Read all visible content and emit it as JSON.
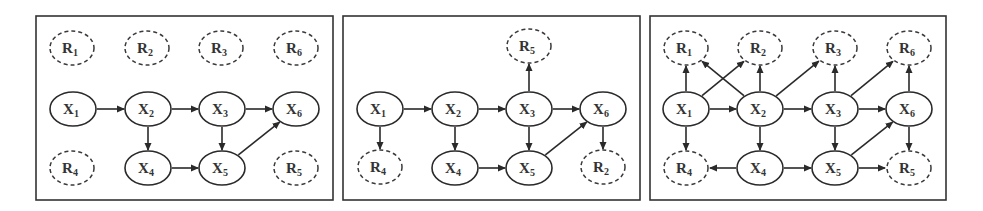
{
  "figure": {
    "width": 983,
    "height": 211,
    "colors": {
      "stroke": "#2a2a2a",
      "label": "#333333",
      "background": "#ffffff"
    },
    "panels": [
      {
        "id": "panel-1",
        "frame": {
          "x": 36,
          "y": 16,
          "w": 297,
          "h": 184
        },
        "nodes": [
          {
            "id": "R1",
            "letter": "R",
            "sub": "1",
            "type": "missing",
            "cx": 72,
            "cy": 48
          },
          {
            "id": "R2",
            "letter": "R",
            "sub": "2",
            "type": "missing",
            "cx": 147,
            "cy": 48
          },
          {
            "id": "R3",
            "letter": "R",
            "sub": "3",
            "type": "missing",
            "cx": 221,
            "cy": 48
          },
          {
            "id": "R6",
            "letter": "R",
            "sub": "6",
            "type": "missing",
            "cx": 296,
            "cy": 48
          },
          {
            "id": "X1",
            "letter": "X",
            "sub": "1",
            "type": "observed",
            "cx": 73,
            "cy": 109
          },
          {
            "id": "X2",
            "letter": "X",
            "sub": "2",
            "type": "observed",
            "cx": 148,
            "cy": 109
          },
          {
            "id": "X3",
            "letter": "X",
            "sub": "3",
            "type": "observed",
            "cx": 222,
            "cy": 109
          },
          {
            "id": "X6",
            "letter": "X",
            "sub": "6",
            "type": "observed",
            "cx": 296,
            "cy": 109
          },
          {
            "id": "R4",
            "letter": "R",
            "sub": "4",
            "type": "missing",
            "cx": 72,
            "cy": 168
          },
          {
            "id": "X4",
            "letter": "X",
            "sub": "4",
            "type": "observed",
            "cx": 148,
            "cy": 168
          },
          {
            "id": "X5",
            "letter": "X",
            "sub": "5",
            "type": "observed",
            "cx": 222,
            "cy": 168
          },
          {
            "id": "R5",
            "letter": "R",
            "sub": "5",
            "type": "missing",
            "cx": 296,
            "cy": 168
          }
        ],
        "edges": [
          [
            "X1",
            "X2"
          ],
          [
            "X2",
            "X3"
          ],
          [
            "X3",
            "X6"
          ],
          [
            "X2",
            "X4"
          ],
          [
            "X3",
            "X5"
          ],
          [
            "X4",
            "X5"
          ],
          [
            "X5",
            "X6"
          ]
        ]
      },
      {
        "id": "panel-2",
        "frame": {
          "x": 343,
          "y": 16,
          "w": 297,
          "h": 184
        },
        "nodes": [
          {
            "id": "R5",
            "letter": "R",
            "sub": "5",
            "type": "missing",
            "cx": 529,
            "cy": 46
          },
          {
            "id": "X1",
            "letter": "X",
            "sub": "1",
            "type": "observed",
            "cx": 380,
            "cy": 109
          },
          {
            "id": "X2",
            "letter": "X",
            "sub": "2",
            "type": "observed",
            "cx": 455,
            "cy": 109
          },
          {
            "id": "X3",
            "letter": "X",
            "sub": "3",
            "type": "observed",
            "cx": 529,
            "cy": 109
          },
          {
            "id": "X6",
            "letter": "X",
            "sub": "6",
            "type": "observed",
            "cx": 603,
            "cy": 109
          },
          {
            "id": "R4",
            "letter": "R",
            "sub": "4",
            "type": "missing",
            "cx": 380,
            "cy": 167
          },
          {
            "id": "X4",
            "letter": "X",
            "sub": "4",
            "type": "observed",
            "cx": 455,
            "cy": 168
          },
          {
            "id": "X5",
            "letter": "X",
            "sub": "5",
            "type": "observed",
            "cx": 529,
            "cy": 168
          },
          {
            "id": "R2",
            "letter": "R",
            "sub": "2",
            "type": "missing",
            "cx": 603,
            "cy": 167
          }
        ],
        "edges": [
          [
            "X1",
            "X2"
          ],
          [
            "X2",
            "X3"
          ],
          [
            "X3",
            "X6"
          ],
          [
            "X1",
            "R4"
          ],
          [
            "X2",
            "X4"
          ],
          [
            "X3",
            "X5"
          ],
          [
            "X3",
            "R5"
          ],
          [
            "X4",
            "X5"
          ],
          [
            "X5",
            "X6"
          ],
          [
            "X6",
            "R2"
          ]
        ]
      },
      {
        "id": "panel-3",
        "frame": {
          "x": 650,
          "y": 16,
          "w": 296,
          "h": 184
        },
        "nodes": [
          {
            "id": "R1",
            "letter": "R",
            "sub": "1",
            "type": "missing",
            "cx": 686,
            "cy": 48
          },
          {
            "id": "R2",
            "letter": "R",
            "sub": "2",
            "type": "missing",
            "cx": 760,
            "cy": 48
          },
          {
            "id": "R3",
            "letter": "R",
            "sub": "3",
            "type": "missing",
            "cx": 835,
            "cy": 48
          },
          {
            "id": "R6",
            "letter": "R",
            "sub": "6",
            "type": "missing",
            "cx": 909,
            "cy": 48
          },
          {
            "id": "X1",
            "letter": "X",
            "sub": "1",
            "type": "observed",
            "cx": 686,
            "cy": 109
          },
          {
            "id": "X2",
            "letter": "X",
            "sub": "2",
            "type": "observed",
            "cx": 760,
            "cy": 109
          },
          {
            "id": "X3",
            "letter": "X",
            "sub": "3",
            "type": "observed",
            "cx": 835,
            "cy": 109
          },
          {
            "id": "X6",
            "letter": "X",
            "sub": "6",
            "type": "observed",
            "cx": 909,
            "cy": 109
          },
          {
            "id": "R4",
            "letter": "R",
            "sub": "4",
            "type": "missing",
            "cx": 686,
            "cy": 168
          },
          {
            "id": "X4",
            "letter": "X",
            "sub": "4",
            "type": "observed",
            "cx": 760,
            "cy": 168
          },
          {
            "id": "X5",
            "letter": "X",
            "sub": "5",
            "type": "observed",
            "cx": 835,
            "cy": 168
          },
          {
            "id": "R5",
            "letter": "R",
            "sub": "5",
            "type": "missing",
            "cx": 909,
            "cy": 168
          }
        ],
        "edges": [
          [
            "X1",
            "X2"
          ],
          [
            "X2",
            "X3"
          ],
          [
            "X3",
            "X6"
          ],
          [
            "X1",
            "R1"
          ],
          [
            "X1",
            "R2"
          ],
          [
            "X2",
            "R1"
          ],
          [
            "X2",
            "R2"
          ],
          [
            "X2",
            "R3"
          ],
          [
            "X3",
            "R3"
          ],
          [
            "X3",
            "R6"
          ],
          [
            "X6",
            "R6"
          ],
          [
            "X1",
            "R4"
          ],
          [
            "X2",
            "X4"
          ],
          [
            "X3",
            "X5"
          ],
          [
            "X4",
            "R4"
          ],
          [
            "X4",
            "X5"
          ],
          [
            "X5",
            "X6"
          ],
          [
            "X5",
            "R5"
          ],
          [
            "X6",
            "R5"
          ]
        ]
      }
    ],
    "node_size": {
      "rx": 23,
      "ry": 17
    }
  }
}
